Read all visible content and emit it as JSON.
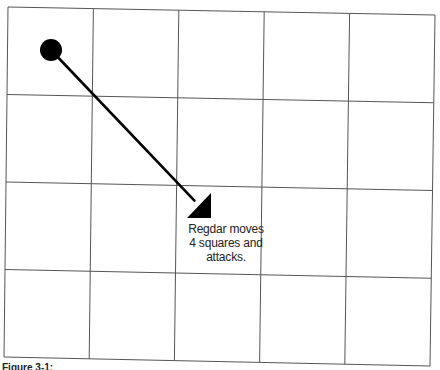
{
  "figure": {
    "grid": {
      "columns": 5,
      "rows": 4,
      "line_color": "#555555",
      "corners": {
        "top_left": [
          8,
          7
        ],
        "top_right": [
          435,
          15
        ],
        "bottom_left": [
          4,
          357
        ],
        "bottom_right": [
          430,
          366
        ]
      }
    },
    "token": {
      "name": "Regdar",
      "center": [
        51,
        50
      ],
      "radius": 11,
      "color": "#000000"
    },
    "arrow": {
      "from": [
        51,
        50
      ],
      "to": [
        211,
        218
      ],
      "color": "#000000"
    },
    "label": {
      "lines": [
        "Regdar moves",
        "4 squares and",
        "attacks."
      ]
    },
    "caption": {
      "text": "Figure 3-1:"
    }
  }
}
